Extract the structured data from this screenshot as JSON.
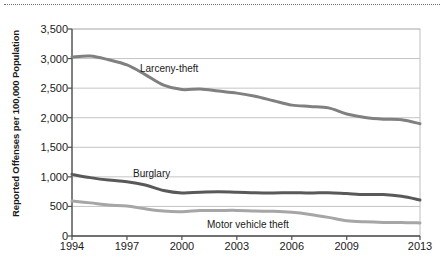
{
  "chart_data": {
    "type": "line",
    "title": "",
    "xlabel": "",
    "ylabel": "Reported Offenses per 100,000 Population",
    "xlim": [
      1994,
      2013
    ],
    "ylim": [
      0,
      3500
    ],
    "grid": true,
    "legend_position": "inline-annotations",
    "x": [
      1994,
      1995,
      1996,
      1997,
      1998,
      1999,
      2000,
      2001,
      2002,
      2003,
      2004,
      2005,
      2006,
      2007,
      2008,
      2009,
      2010,
      2011,
      2012,
      2013
    ],
    "xticks": [
      "1994",
      "1997",
      "2000",
      "2003",
      "2006",
      "2009",
      "2013"
    ],
    "yticks": [
      "0",
      "500",
      "1,000",
      "1,500",
      "2,000",
      "2,500",
      "3,000",
      "3,500"
    ],
    "series": [
      {
        "name": "Larceny-theft",
        "color": "#808080",
        "values": [
          3026,
          3043,
          2980,
          2892,
          2729,
          2551,
          2477,
          2486,
          2451,
          2416,
          2362,
          2287,
          2213,
          2190,
          2166,
          2064,
          2005,
          1976,
          1965,
          1899
        ]
      },
      {
        "name": "Burglary",
        "color": "#595959",
        "values": [
          1042,
          987,
          945,
          919,
          863,
          770,
          729,
          741,
          747,
          741,
          730,
          727,
          733,
          726,
          733,
          717,
          701,
          702,
          672,
          610
        ]
      },
      {
        "name": "Motor vehicle theft",
        "color": "#a6a6a6",
        "values": [
          591,
          560,
          526,
          506,
          459,
          422,
          412,
          431,
          432,
          433,
          422,
          417,
          400,
          364,
          315,
          259,
          239,
          230,
          230,
          221
        ]
      }
    ],
    "annotations": [
      {
        "label": "Larceny-theft",
        "x": 140,
        "y": 63
      },
      {
        "label": "Burglary",
        "x": 133,
        "y": 168
      },
      {
        "label": "Motor vehicle theft",
        "x": 207,
        "y": 219
      }
    ]
  }
}
